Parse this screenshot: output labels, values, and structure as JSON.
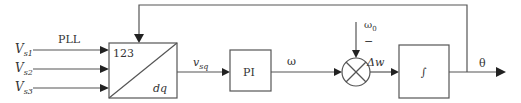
{
  "diagram": {
    "title": "PLL",
    "inputs": [
      {
        "symbol": "V",
        "sub": "s1"
      },
      {
        "symbol": "V",
        "sub": "s2"
      },
      {
        "symbol": "V",
        "sub": "s3"
      }
    ],
    "transform_block": {
      "top_label": "123",
      "bottom_label": "dq"
    },
    "signal_vsq": {
      "symbol": "v",
      "sub": "sq"
    },
    "pi_block": {
      "label": "PI"
    },
    "signal_omega": "ω",
    "reference": {
      "symbol": "ω",
      "sub": "0",
      "sign": "−"
    },
    "signal_delta_w": "Δw",
    "integrator_block": {
      "label": "∫"
    },
    "output": "θ",
    "colors": {
      "line": "#555555",
      "arrow": "#222222",
      "text": "#333333"
    }
  }
}
